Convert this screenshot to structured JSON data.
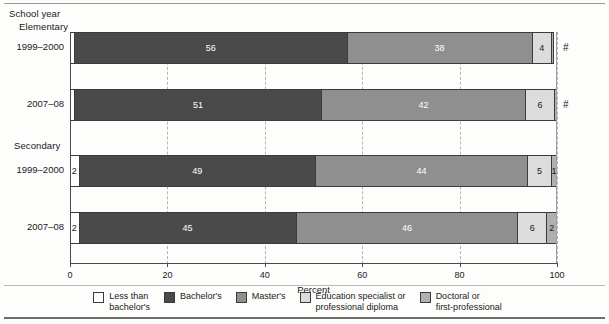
{
  "header": {
    "school_year_label": "School year",
    "group_elementary": "Elementary",
    "group_secondary": "Secondary"
  },
  "axis": {
    "x_title": "Percent",
    "ticks": [
      "0",
      "20",
      "40",
      "60",
      "80",
      "100"
    ]
  },
  "rows": [
    {
      "label": "1999–2000",
      "suffix": "#"
    },
    {
      "label": "2007–08",
      "suffix": "#"
    },
    {
      "label": "1999–2000",
      "suffix": ""
    },
    {
      "label": "2007–08",
      "suffix": ""
    }
  ],
  "legend": [
    {
      "name": "less-than-bachelors",
      "text": "Less than\nbachelor's",
      "color": "#ffffff"
    },
    {
      "name": "bachelors",
      "text": "Bachelor's",
      "color": "#4a4a4a"
    },
    {
      "name": "masters",
      "text": "Master's",
      "color": "#8f8f8f"
    },
    {
      "name": "education-specialist",
      "text": "Education specialist or\nprofessional diploma",
      "color": "#dcdcdc"
    },
    {
      "name": "doctoral",
      "text": "Doctoral or\nfirst-professional",
      "color": "#b0b0b0"
    }
  ],
  "chart_data": {
    "type": "bar",
    "orientation": "horizontal",
    "stacked": true,
    "title": "",
    "xlabel": "Percent",
    "ylabel": "School year",
    "xlim": [
      0,
      100
    ],
    "xticks": [
      0,
      20,
      40,
      60,
      80,
      100
    ],
    "grid": "vertical-dashed",
    "legend_position": "bottom",
    "groups": [
      "Elementary",
      "Secondary"
    ],
    "categories": [
      "1999–2000",
      "2007–08",
      "1999–2000",
      "2007–08"
    ],
    "series": [
      {
        "name": "Less than bachelor's",
        "color": "#ffffff",
        "values": [
          1,
          1,
          2,
          2
        ],
        "labels": [
          "",
          "",
          "2",
          "2"
        ]
      },
      {
        "name": "Bachelor's",
        "color": "#4a4a4a",
        "values": [
          56,
          51,
          49,
          45
        ],
        "labels": [
          "56",
          "51",
          "49",
          "45"
        ]
      },
      {
        "name": "Master's",
        "color": "#8f8f8f",
        "values": [
          38,
          42,
          44,
          46
        ],
        "labels": [
          "38",
          "42",
          "44",
          "46"
        ]
      },
      {
        "name": "Education specialist or professional diploma",
        "color": "#dcdcdc",
        "values": [
          4,
          6,
          5,
          6
        ],
        "labels": [
          "4",
          "6",
          "5",
          "6"
        ]
      },
      {
        "name": "Doctoral or first-professional",
        "color": "#b0b0b0",
        "values": [
          0.4,
          0.4,
          1,
          2
        ],
        "labels": [
          "",
          "",
          "1",
          "2"
        ]
      }
    ],
    "row_suffixes": [
      "#",
      "#",
      "",
      ""
    ],
    "footnote_symbol": "#"
  }
}
